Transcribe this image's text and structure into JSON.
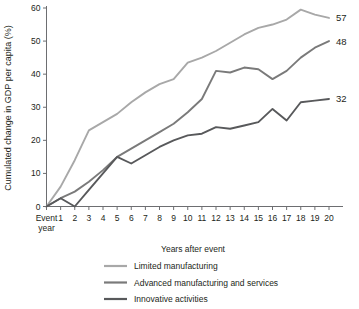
{
  "chart_data": {
    "type": "line",
    "title": "",
    "xlabel": "Years after event",
    "ylabel": "Cumulated change in GDP per capita (%)",
    "xlim": [
      0,
      20
    ],
    "ylim": [
      0,
      60
    ],
    "grid": false,
    "legend_position": "bottom-left",
    "x": [
      0,
      1,
      2,
      3,
      4,
      5,
      6,
      7,
      8,
      9,
      10,
      11,
      12,
      13,
      14,
      15,
      16,
      17,
      18,
      19,
      20
    ],
    "x_tick_labels": [
      "Event\nyear",
      "1",
      "2",
      "3",
      "4",
      "5",
      "6",
      "7",
      "8",
      "9",
      "10",
      "11",
      "12",
      "13",
      "14",
      "15",
      "16",
      "17",
      "18",
      "19",
      "20"
    ],
    "x_first_tick_label_line1": "Event",
    "x_first_tick_label_line2": "year",
    "y_tick_labels": [
      "0",
      "10",
      "20",
      "30",
      "40",
      "50",
      "60"
    ],
    "y_ticks": [
      0,
      10,
      20,
      30,
      40,
      50,
      60
    ],
    "series": [
      {
        "name": "Limited manufacturing",
        "color": "#a8a8a8",
        "end_label": "57",
        "values": [
          0,
          6,
          14,
          23,
          25.5,
          28,
          31.5,
          34.5,
          37,
          38.5,
          43.5,
          45,
          47,
          49.5,
          52,
          54,
          55,
          56.5,
          59.5,
          58,
          57
        ]
      },
      {
        "name": "Advanced manufacturing and services",
        "color": "#7a7a7a",
        "end_label": "48",
        "values": [
          0,
          2.5,
          4.5,
          7.5,
          11,
          15,
          17.5,
          20,
          22.5,
          25,
          28.5,
          32.5,
          41,
          40.5,
          42,
          41.5,
          38.5,
          41,
          45,
          48,
          50
        ]
      },
      {
        "name": "Innovative activities",
        "color": "#58595b",
        "end_label": "32",
        "values": [
          0,
          2.5,
          0,
          5,
          10,
          15,
          13,
          15.5,
          18,
          20,
          21.5,
          22,
          24,
          23.5,
          24.5,
          25.5,
          29.5,
          26,
          31.5,
          32,
          32.5
        ]
      }
    ]
  },
  "legend": {
    "items": [
      {
        "label": "Limited manufacturing",
        "color": "#a8a8a8"
      },
      {
        "label": "Advanced manufacturing and services",
        "color": "#7a7a7a"
      },
      {
        "label": "Innovative activities",
        "color": "#58595b"
      }
    ]
  }
}
